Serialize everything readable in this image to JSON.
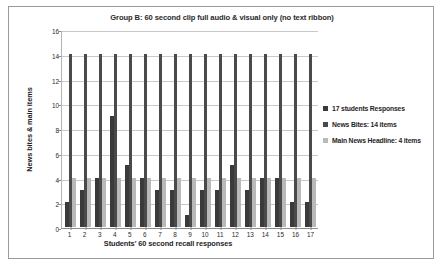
{
  "figure": {
    "title": "Group B: 60 second clip full audio & visual only (no text ribbon)"
  },
  "legend": {
    "items": [
      {
        "label": "17 students Responses",
        "color": "#3a3a3a"
      },
      {
        "label": "News Bites: 14 items",
        "color": "#4a4a4a"
      },
      {
        "label": "Main News Headline: 4 items",
        "color": "#b9b9b9"
      }
    ]
  },
  "chart_data": {
    "type": "bar",
    "title": "Group B: 60 second clip full audio & visual only (no text ribbon)",
    "xlabel": "Students' 60 second recall responses",
    "ylabel": "News bites & main items",
    "categories": [
      "1",
      "2",
      "3",
      "4",
      "5",
      "6",
      "7",
      "8",
      "9",
      "10",
      "11",
      "12",
      "13",
      "14",
      "15",
      "16",
      "17"
    ],
    "series": [
      {
        "name": "17 students Responses",
        "color": "#3a3a3a",
        "values": [
          2,
          3,
          4,
          9,
          5,
          4,
          3,
          3,
          1,
          3,
          3,
          5,
          3,
          4,
          4,
          2,
          2
        ]
      },
      {
        "name": "News Bites: 14 items",
        "color": "#4a4a4a",
        "values": [
          14,
          14,
          14,
          14,
          14,
          14,
          14,
          14,
          14,
          14,
          14,
          14,
          14,
          14,
          14,
          14,
          14
        ]
      },
      {
        "name": "Main News Headline: 4 items",
        "color": "#b9b9b9",
        "values": [
          4,
          4,
          4,
          4,
          4,
          4,
          4,
          4,
          4,
          4,
          4,
          4,
          4,
          4,
          4,
          4,
          4
        ]
      }
    ],
    "ylim": [
      0,
      16
    ],
    "yticks": [
      0,
      2,
      4,
      6,
      8,
      10,
      12,
      14,
      16
    ],
    "ytick_labels": [
      "0",
      "2",
      "4",
      "6",
      "8",
      "10",
      "12",
      "14",
      "16"
    ],
    "grid": true,
    "legend_position": "right"
  }
}
